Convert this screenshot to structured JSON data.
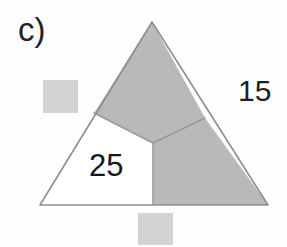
{
  "figure": {
    "panel_label": "c)",
    "background_color": "#fefefe",
    "shaded_fill": "#b9b9b9",
    "unshaded_fill": "#ffffff",
    "outline_color": "#8e8e8e",
    "inner_line_color": "#9a9a9a",
    "outline_width": 1.6,
    "inner_line_width": 1.6
  },
  "triangle": {
    "name": "outer-triangle",
    "vertices": {
      "apex": {
        "x": 152,
        "y": 22
      },
      "bottom_left": {
        "x": 40,
        "y": 205
      },
      "bottom_right": {
        "x": 268,
        "y": 205
      }
    },
    "interior_point": {
      "x": 153,
      "y": 143
    },
    "edge_contacts": {
      "left_edge": {
        "x": 94,
        "y": 113
      },
      "right_edge": {
        "x": 205,
        "y": 118
      },
      "base": {
        "x": 153,
        "y": 205
      }
    }
  },
  "regions": [
    {
      "name": "top-region",
      "shaded": true,
      "fill": "#b9b9b9",
      "label": "",
      "points": "152,22 94,113 153,143 205,118"
    },
    {
      "name": "right-region",
      "shaded": true,
      "fill": "#b9b9b9",
      "label": "",
      "points": "205,118 268,205 153,205 153,143"
    },
    {
      "name": "left-region",
      "shaded": false,
      "fill": "#ffffff",
      "label": "25",
      "points": "94,113 40,205 153,205 153,143"
    }
  ],
  "labels": {
    "panel": "c)",
    "outer_right_value": "15",
    "left_region_value": "25"
  },
  "scan_artifacts": [
    {
      "name": "scan-square-left",
      "x": 43,
      "y": 80,
      "width": 35,
      "height": 33,
      "color": "#c9c9c9"
    },
    {
      "name": "scan-square-bottom",
      "x": 138,
      "y": 213,
      "width": 35,
      "height": 32,
      "color": "#c9c9c9"
    }
  ]
}
